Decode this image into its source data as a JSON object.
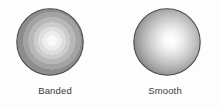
{
  "figure": {
    "background_color": "#fdfdfd",
    "width": 220,
    "height": 107
  },
  "panels": [
    {
      "id": "banded",
      "caption": "Banded",
      "shading_type": "banded",
      "sphere": {
        "center_x": 50,
        "center_y": 42,
        "diameter": 68,
        "highlight_x": 52,
        "highlight_y": 41,
        "outline_color": "#4a4a4a",
        "band_count": 9,
        "band_colors": [
          "#fafafa",
          "#ededed",
          "#dedede",
          "#cccccc",
          "#b8b8b8",
          "#a3a3a3",
          "#8d8d8d",
          "#757575",
          "#5c5c5c"
        ],
        "band_stops": [
          0,
          12,
          22,
          32,
          42,
          54,
          66,
          80,
          92,
          100
        ]
      }
    },
    {
      "id": "smooth",
      "caption": "Smooth",
      "shading_type": "smooth",
      "sphere": {
        "center_x": 167,
        "center_y": 42,
        "diameter": 68,
        "highlight_x": 172,
        "highlight_y": 40,
        "outline_color": "#4a4a4a",
        "gradient_inner_color": "#ffffff",
        "gradient_outer_color": "#5e5e5e"
      }
    }
  ],
  "caption_style": {
    "color": "#3a3a3a",
    "font_size_px": 9.5
  }
}
